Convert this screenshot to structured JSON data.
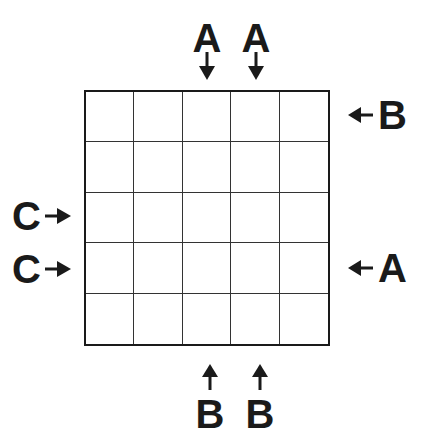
{
  "puzzle": {
    "grid": {
      "rows": 5,
      "cols": 5,
      "cells": [
        [
          "",
          "",
          "",
          "",
          ""
        ],
        [
          "",
          "",
          "",
          "",
          ""
        ],
        [
          "",
          "",
          "",
          "",
          ""
        ],
        [
          "",
          "",
          "",
          "",
          ""
        ],
        [
          "",
          "",
          "",
          "",
          ""
        ]
      ]
    },
    "clues": {
      "top": [
        {
          "col": 3,
          "letter": "A",
          "arrow": "down-arrow-icon"
        },
        {
          "col": 4,
          "letter": "A",
          "arrow": "down-arrow-icon"
        }
      ],
      "right": [
        {
          "row": 1,
          "letter": "B",
          "arrow": "left-arrow-icon"
        },
        {
          "row": 4,
          "letter": "A",
          "arrow": "left-arrow-icon"
        }
      ],
      "left": [
        {
          "row": 3,
          "letter": "C",
          "arrow": "right-arrow-icon"
        },
        {
          "row": 4,
          "letter": "C",
          "arrow": "right-arrow-icon"
        }
      ],
      "bottom": [
        {
          "col": 3,
          "letter": "B",
          "arrow": "up-arrow-icon"
        },
        {
          "col": 4,
          "letter": "B",
          "arrow": "up-arrow-icon"
        }
      ]
    },
    "colors": {
      "ink": "#1a1a1a",
      "background": "#ffffff"
    }
  }
}
